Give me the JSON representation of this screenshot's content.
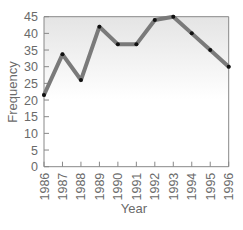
{
  "chart_data": {
    "type": "line",
    "title": "",
    "xlabel": "Year",
    "ylabel": "Frequency",
    "categories": [
      "1986",
      "1987",
      "1988",
      "1989",
      "1990",
      "1991",
      "1992",
      "1993",
      "1994",
      "1995",
      "1996"
    ],
    "x": [
      1986,
      1987,
      1988,
      1989,
      1990,
      1991,
      1992,
      1993,
      1994,
      1995,
      1996
    ],
    "values": [
      21.5,
      33.7,
      26,
      42,
      36.7,
      36.7,
      44,
      45,
      40,
      35,
      30
    ],
    "ylim": [
      0,
      45
    ],
    "yticks": [
      0,
      5,
      10,
      15,
      20,
      25,
      30,
      35,
      40,
      45
    ],
    "grid": false,
    "legend": null,
    "colors": {
      "line": "#7a7a7a",
      "marker": "#111111",
      "axis": "#888888",
      "background_top": "#e6e6e6",
      "background_bottom": "#ffffff"
    }
  }
}
